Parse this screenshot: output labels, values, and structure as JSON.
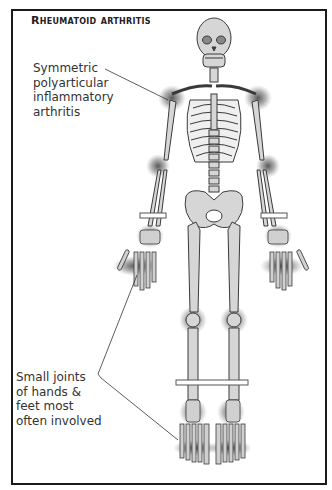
{
  "title": "Rheumatoid arthritis",
  "annotations": [
    {
      "id": "symmetric",
      "text": "Symmetric\npolyarticular\ninflammatory\narthritis"
    },
    {
      "id": "small-joints",
      "text": "Small joints\nof hands &\nfeet most\noften involved"
    }
  ],
  "colors": {
    "frame": "#1a1a1a",
    "bone_fill": "#d6d6d6",
    "bone_stroke": "#3a3a3a",
    "inflammation": "#555555",
    "text": "#333333"
  }
}
